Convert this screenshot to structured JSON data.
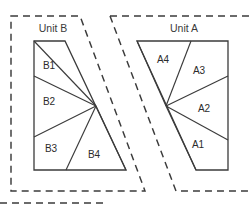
{
  "figure": {
    "type": "zone-partition-diagram",
    "background_color": "#ffffff",
    "line_color": "#3b3b3b",
    "canvas": {
      "width": 251,
      "height": 210
    }
  },
  "units": [
    {
      "id": "unit-b",
      "title": "Unit B",
      "title_position": {
        "x": 53,
        "y": 32
      },
      "orientation": "left",
      "fan_center": {
        "x": 96,
        "y": 106
      },
      "outline_points": "34,41 65,41 126,170 34,170",
      "sectors": [
        {
          "id": "B1",
          "label": "B1",
          "label_x": 49,
          "label_y": 69
        },
        {
          "id": "B2",
          "label": "B2",
          "label_x": 49,
          "label_y": 105
        },
        {
          "id": "B3",
          "label": "B3",
          "label_x": 51,
          "label_y": 152
        },
        {
          "id": "B4",
          "label": "B4",
          "label_x": 94,
          "label_y": 158
        }
      ],
      "spokes": [
        {
          "from": "34,41",
          "to": "96,106"
        },
        {
          "from": "34,76",
          "to": "96,106"
        },
        {
          "from": "34,137",
          "to": "96,106"
        },
        {
          "from": "66,170",
          "to": "96,106"
        },
        {
          "from": "126,170",
          "to": "96,106"
        }
      ]
    },
    {
      "id": "unit-a",
      "title": "Unit A",
      "title_position": {
        "x": 184,
        "y": 32
      },
      "orientation": "right",
      "fan_center": {
        "x": 166,
        "y": 106
      },
      "outline_points": "137,41 228,41 228,170 196,170",
      "sectors": [
        {
          "id": "A4",
          "label": "A4",
          "label_x": 163,
          "label_y": 63
        },
        {
          "id": "A3",
          "label": "A3",
          "label_x": 199,
          "label_y": 74
        },
        {
          "id": "A2",
          "label": "A2",
          "label_x": 204,
          "label_y": 112
        },
        {
          "id": "A1",
          "label": "A1",
          "label_x": 198,
          "label_y": 148
        }
      ],
      "spokes": [
        {
          "from": "137,41",
          "to": "166,106"
        },
        {
          "from": "191,41",
          "to": "166,106"
        },
        {
          "from": "228,76",
          "to": "166,106"
        },
        {
          "from": "228,140",
          "to": "166,106"
        },
        {
          "from": "196,170",
          "to": "166,106"
        }
      ]
    }
  ],
  "zones": [
    {
      "id": "zone-b",
      "belongs_to": "Unit B",
      "style": "dashed",
      "path": "M 11,16 L 80,16 L 145,191 L 11,191 Z"
    },
    {
      "id": "zone-a",
      "belongs_to": "Unit A",
      "style": "dashed",
      "path": "M 110,16 L 251,16 M 110,16 L 176,191 L 251,191"
    },
    {
      "id": "zone-bottom-strip",
      "belongs_to": "",
      "style": "dashed",
      "path": "M 0,203 L 103,203"
    }
  ]
}
